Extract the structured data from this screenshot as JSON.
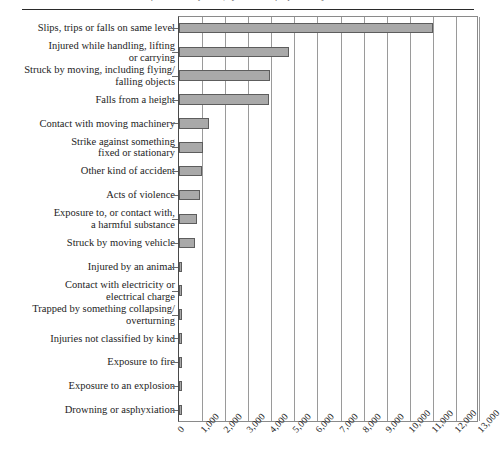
{
  "figure": {
    "ghost_title": "Kinds of accident reported, by number of reported injuries",
    "axis_max_label": "13,000"
  },
  "chart_data": {
    "type": "bar",
    "orientation": "horizontal",
    "title": "",
    "xlabel": "",
    "ylabel": "",
    "xlim": [
      0,
      13000
    ],
    "grid": true,
    "legend": false,
    "bar_color": "#a9a9a9",
    "bar_border_color": "#5d5d5d",
    "xticks": [
      "0",
      "1,000",
      "2,000",
      "3,000",
      "4,000",
      "5,000",
      "6,000",
      "7,000",
      "8,000",
      "9,000",
      "10,000",
      "11,000",
      "12,000",
      "13,000"
    ],
    "xtick_values": [
      0,
      1000,
      2000,
      3000,
      4000,
      5000,
      6000,
      7000,
      8000,
      9000,
      10000,
      11000,
      12000,
      13000
    ],
    "categories": [
      "Slips, trips or falls on same level",
      "Injured while handling, lifting\nor carrying",
      "Struck by moving, including flying/\nfalling objects",
      "Falls from a height",
      "Contact with moving machinery",
      "Strike against something\nfixed or stationary",
      "Other kind of accident",
      "Acts of violence",
      "Exposure to, or contact with,\na harmful substance",
      "Struck by moving vehicle",
      "Injured by an animal",
      "Contact with electricity or\nelectrical charge",
      "Trapped by something collapsing/\noverturning",
      "Injuries not classified by kind",
      "Exposure to fire",
      "Exposure to an explosion",
      "Drowning or asphyxiation"
    ],
    "values": [
      11000,
      4750,
      3950,
      3900,
      1300,
      1050,
      980,
      930,
      800,
      700,
      130,
      90,
      80,
      70,
      50,
      45,
      15
    ]
  }
}
